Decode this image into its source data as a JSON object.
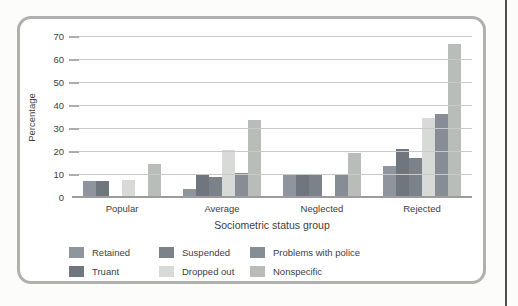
{
  "page": {
    "background": "#fcfcfb",
    "page_edge_color": "#4f4f4f",
    "card_border_color": "#b0b0ae"
  },
  "chart_data": {
    "type": "bar",
    "xlabel": "Sociometric status group",
    "ylabel": "Percentage",
    "ylim": [
      0,
      70
    ],
    "yticks": [
      0,
      10,
      20,
      30,
      40,
      50,
      60,
      70
    ],
    "grid": "horizontal",
    "legend_position": "bottom",
    "legend_layout": "3-columns-2-rows",
    "categories": [
      "Popular",
      "Average",
      "Neglected",
      "Rejected"
    ],
    "series": [
      {
        "name": "Retained",
        "color": "#8e959c",
        "values": [
          7.5,
          4,
          10,
          14
        ]
      },
      {
        "name": "Truant",
        "color": "#6f767e",
        "values": [
          7.5,
          10,
          10,
          21.5
        ]
      },
      {
        "name": "Suspended",
        "color": "#7b828a",
        "values": [
          0,
          9,
          10,
          17.5
        ]
      },
      {
        "name": "Dropped out",
        "color": "#d7dad6",
        "values": [
          8,
          21,
          0,
          35
        ]
      },
      {
        "name": "Problems with police",
        "color": "#868d94",
        "values": [
          0,
          11,
          10,
          36.5
        ]
      },
      {
        "name": "Nonspecific",
        "color": "#b8bdba",
        "values": [
          15,
          34,
          19.5,
          67
        ]
      }
    ]
  }
}
